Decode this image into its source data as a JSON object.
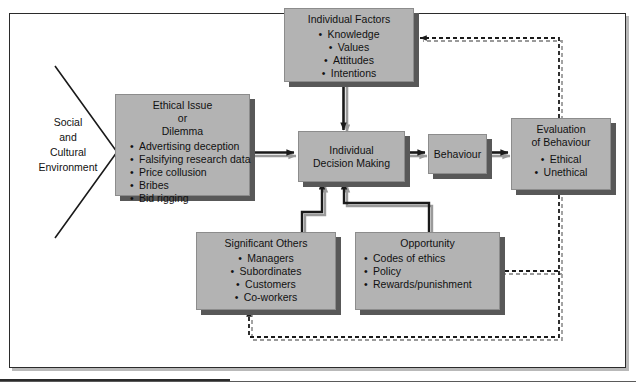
{
  "diagram": {
    "environment": {
      "label": "Social\nand\nCultural\nEnvironment"
    },
    "boxes": {
      "individual_factors": {
        "title": "Individual Factors",
        "items": [
          "Knowledge",
          "Values",
          "Attitudes",
          "Intentions"
        ]
      },
      "ethical_issue": {
        "title": "Ethical Issue\nor\nDilemma",
        "items": [
          "Advertising deception",
          "Falsifying research data",
          "Price collusion",
          "Bribes",
          "Bid rigging"
        ]
      },
      "individual_decision_making": {
        "title": "Individual\nDecision Making",
        "items": []
      },
      "behaviour": {
        "title": "Behaviour",
        "items": []
      },
      "evaluation_of_behaviour": {
        "title": "Evaluation\nof Behaviour",
        "items": [
          "Ethical",
          "Unethical"
        ]
      },
      "significant_others": {
        "title": "Significant Others",
        "items": [
          "Managers",
          "Subordinates",
          "Customers",
          "Co-workers"
        ]
      },
      "opportunity": {
        "title": "Opportunity",
        "items": [
          "Codes of ethics",
          "Policy",
          "Rewards/punishment"
        ]
      }
    },
    "colors": {
      "box_fill": "#b3b3b3",
      "box_shadow": "#585858",
      "frame_border": "#2b2b2b",
      "arrow": "#1a1a1a",
      "arrow_highlight": "#9a9a9a",
      "page_background": "#ffffff"
    },
    "caption": ""
  }
}
